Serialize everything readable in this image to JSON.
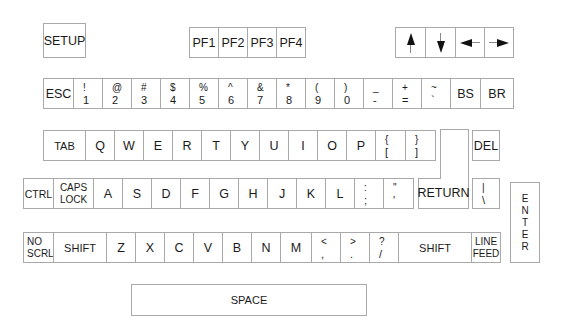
{
  "keyboard": {
    "setup": "SETUP",
    "pf_keys": [
      "PF1",
      "PF2",
      "PF3",
      "PF4"
    ],
    "arrow_keys": [
      "up-arrow",
      "down-arrow",
      "left-arrow",
      "right-arrow"
    ],
    "row1": [
      {
        "main": "ESC"
      },
      {
        "top": "!",
        "bottom": "1"
      },
      {
        "top": "@",
        "bottom": "2"
      },
      {
        "top": "#",
        "bottom": "3"
      },
      {
        "top": "$",
        "bottom": "4"
      },
      {
        "top": "%",
        "bottom": "5"
      },
      {
        "top": "^",
        "bottom": "6"
      },
      {
        "top": "&",
        "bottom": "7"
      },
      {
        "top": "*",
        "bottom": "8"
      },
      {
        "top": "(",
        "bottom": "9"
      },
      {
        "top": ")",
        "bottom": "0"
      },
      {
        "top": "_",
        "bottom": "-"
      },
      {
        "top": "+",
        "bottom": "="
      },
      {
        "top": "~",
        "bottom": "`"
      },
      {
        "main": "BS"
      },
      {
        "main": "BR"
      }
    ],
    "row2": [
      {
        "main": "TAB"
      },
      {
        "main": "Q"
      },
      {
        "main": "W"
      },
      {
        "main": "E"
      },
      {
        "main": "R"
      },
      {
        "main": "T"
      },
      {
        "main": "Y"
      },
      {
        "main": "U"
      },
      {
        "main": "I"
      },
      {
        "main": "O"
      },
      {
        "main": "P"
      },
      {
        "top": "{",
        "bottom": "["
      },
      {
        "top": "}",
        "bottom": "]"
      }
    ],
    "del": "DEL",
    "row3": [
      {
        "main": "CTRL"
      },
      {
        "line1": "CAPS",
        "line2": "LOCK"
      },
      {
        "main": "A"
      },
      {
        "main": "S"
      },
      {
        "main": "D"
      },
      {
        "main": "F"
      },
      {
        "main": "G"
      },
      {
        "main": "H"
      },
      {
        "main": "J"
      },
      {
        "main": "K"
      },
      {
        "main": "L"
      },
      {
        "top": ":",
        "bottom": ";"
      },
      {
        "top": "\"",
        "bottom": "'"
      }
    ],
    "return": "RETURN",
    "pipe_key": {
      "top": "|",
      "bottom": "\\"
    },
    "enter": [
      "E",
      "N",
      "T",
      "E",
      "R"
    ],
    "row4": [
      {
        "line1": "NO",
        "line2": "SCRL"
      },
      {
        "main": "SHIFT"
      },
      {
        "main": "Z"
      },
      {
        "main": "X"
      },
      {
        "main": "C"
      },
      {
        "main": "V"
      },
      {
        "main": "B"
      },
      {
        "main": "N"
      },
      {
        "main": "M"
      },
      {
        "top": "<",
        "bottom": ","
      },
      {
        "top": ">",
        "bottom": "."
      },
      {
        "top": "?",
        "bottom": "/"
      },
      {
        "main": "SHIFT"
      },
      {
        "line1": "LINE",
        "line2": "FEED"
      }
    ],
    "space": "SPACE"
  }
}
